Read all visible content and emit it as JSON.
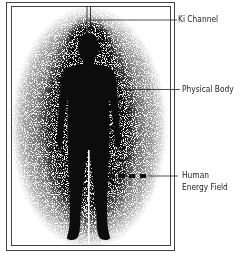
{
  "diagram": {
    "type": "labeled-illustration",
    "colors": {
      "ink": "#111111",
      "background": "#ffffff",
      "frame": "#333333"
    },
    "labels": [
      {
        "id": "ki-channel",
        "text": "Ki Channel"
      },
      {
        "id": "physical-body",
        "text": "Physical Body"
      },
      {
        "id": "human-energy-field",
        "line1": "Human",
        "line2": "Energy Field"
      }
    ]
  }
}
